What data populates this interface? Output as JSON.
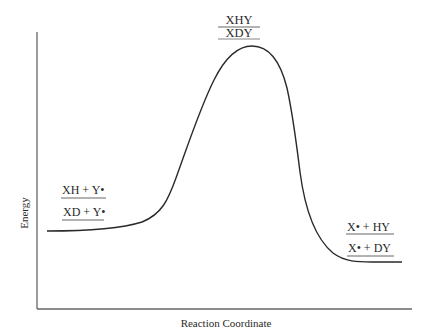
{
  "diagram": {
    "type": "reaction-energy-profile",
    "y_axis_label": "Energy",
    "x_axis_label": "Reaction Coordinate",
    "transition_state": {
      "top_label": "XHY",
      "bottom_label": "XDY"
    },
    "reactants": {
      "upper_label": "XH + Y•",
      "lower_label": "XD + Y•"
    },
    "products": {
      "upper_label": "X• + HY",
      "lower_label": "X• + DY"
    },
    "colors": {
      "line": "#2a2a2a",
      "axis": "#555555",
      "background": "#ffffff"
    }
  }
}
